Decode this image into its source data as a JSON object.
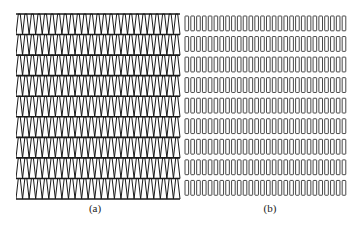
{
  "figure": {
    "panels": [
      {
        "id": "a",
        "caption": "(a)",
        "pattern": "triangular-zigzag-rows",
        "rows": 9,
        "teeth_per_row": 25,
        "stroke": "#1a1a1a"
      },
      {
        "id": "b",
        "caption": "(b)",
        "pattern": "rectangular-slot-rows",
        "rows": 9,
        "slots_per_row": 28,
        "stroke": "#333333"
      }
    ]
  }
}
